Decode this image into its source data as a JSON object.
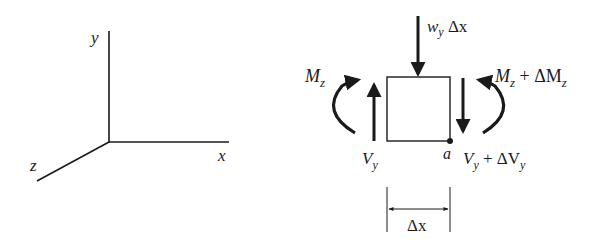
{
  "axes": {
    "x_label": "x",
    "y_label": "y",
    "z_label": "z"
  },
  "element": {
    "distributed_load": {
      "symbol": "w",
      "sub": "y",
      "suffix": " Δx"
    },
    "left_moment": {
      "symbol": "M",
      "sub": "z"
    },
    "right_moment": {
      "symbol": "M",
      "sub": "z",
      "plus": " + ΔM",
      "sub2": "z"
    },
    "left_shear": {
      "symbol": "V",
      "sub": "y"
    },
    "right_shear": {
      "symbol": "V",
      "sub": "y",
      "plus": " + ΔV",
      "sub2": "y"
    },
    "point_label": "a",
    "dimension_label": "Δx"
  },
  "colors": {
    "ink": "#1a1a1a",
    "background": "#ffffff"
  }
}
